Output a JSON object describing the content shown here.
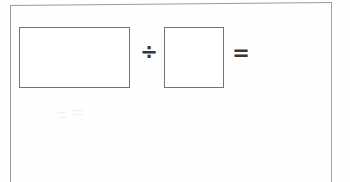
{
  "document": {
    "type": "scanned-worksheet",
    "background_color": "#fefefe",
    "border_color": "#9a9a9a"
  },
  "equation": {
    "description": "Blank division equation template",
    "line_color": "#73737a",
    "operator_color": "#37373a",
    "dividend_box": {
      "label": "",
      "placeholder": "",
      "shape": "rectangle"
    },
    "divide_operator": "÷",
    "divisor_box": {
      "label": "",
      "placeholder": "",
      "shape": "square"
    },
    "equals_operator": "=",
    "result": ""
  },
  "annotations": {
    "erased_pencil_marks": ""
  }
}
